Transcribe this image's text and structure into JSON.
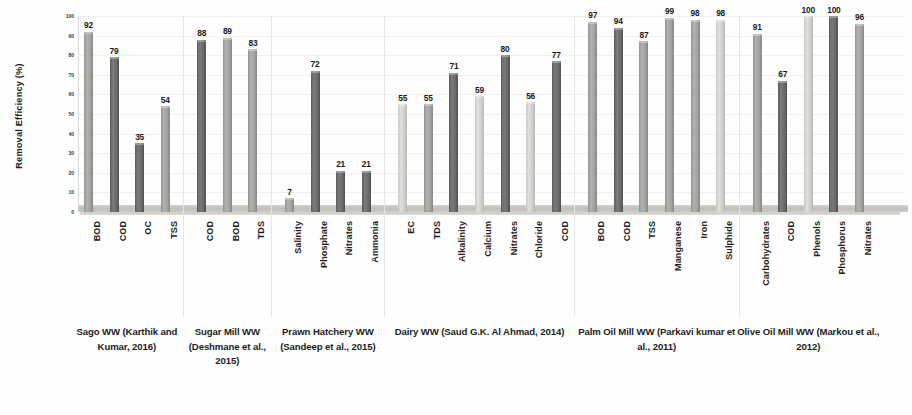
{
  "chart_data": {
    "type": "bar",
    "title": "",
    "xlabel": "",
    "ylabel": "Removal Efficiency (%)",
    "ylim": [
      0,
      100
    ],
    "ytick_values": [
      100,
      90,
      80,
      70,
      60,
      50,
      40,
      30,
      20,
      10,
      0
    ],
    "grid": true,
    "legend": "none",
    "categories": [
      "BOD",
      "COD",
      "OC",
      "TSS",
      "COD",
      "BOD",
      "TDS",
      "Salinity",
      "Phosphate",
      "Nitrates",
      "Ammonia",
      "EC",
      "TDS",
      "Alkalinity",
      "Calcium",
      "Nitrates",
      "Chloride",
      "COD",
      "BOD",
      "COD",
      "TSS",
      "Manganese",
      "Iron",
      "Sulphide",
      "Carbohydrates",
      "COD",
      "Phenols",
      "Phosphorus",
      "Nitrates"
    ],
    "values": [
      92,
      79,
      35,
      54,
      88,
      89,
      83,
      7,
      72,
      21,
      21,
      55,
      55,
      71,
      59,
      80,
      56,
      77,
      97,
      94,
      87,
      99,
      98,
      98,
      91,
      67,
      100,
      100,
      96
    ],
    "bar_shades": [
      "mid",
      "dark",
      "dark",
      "mid",
      "dark",
      "mid",
      "mid",
      "mid",
      "dark",
      "dark",
      "dark",
      "light",
      "mid",
      "dark",
      "light",
      "dark",
      "light",
      "dark",
      "mid",
      "dark",
      "mid",
      "mid",
      "mid",
      "light",
      "mid",
      "dark",
      "light",
      "dark",
      "mid"
    ],
    "groups": [
      {
        "label": "Sago WW (Karthik and Kumar, 2016)",
        "bar_count": 4
      },
      {
        "label": "Sugar Mill WW (Deshmane et al., 2015)",
        "bar_count": 3
      },
      {
        "label": "Prawn Hatchery WW (Sandeep et al., 2015)",
        "bar_count": 4
      },
      {
        "label": "Dairy WW (Saud G.K. Al Ahmad, 2014)",
        "bar_count": 7
      },
      {
        "label": "Palm Oil Mill WW (Parkavi kumar et al., 2011)",
        "bar_count": 6
      },
      {
        "label": "Olive Oil Mill WW (Markou et al., 2012)",
        "bar_count": 5
      }
    ]
  }
}
